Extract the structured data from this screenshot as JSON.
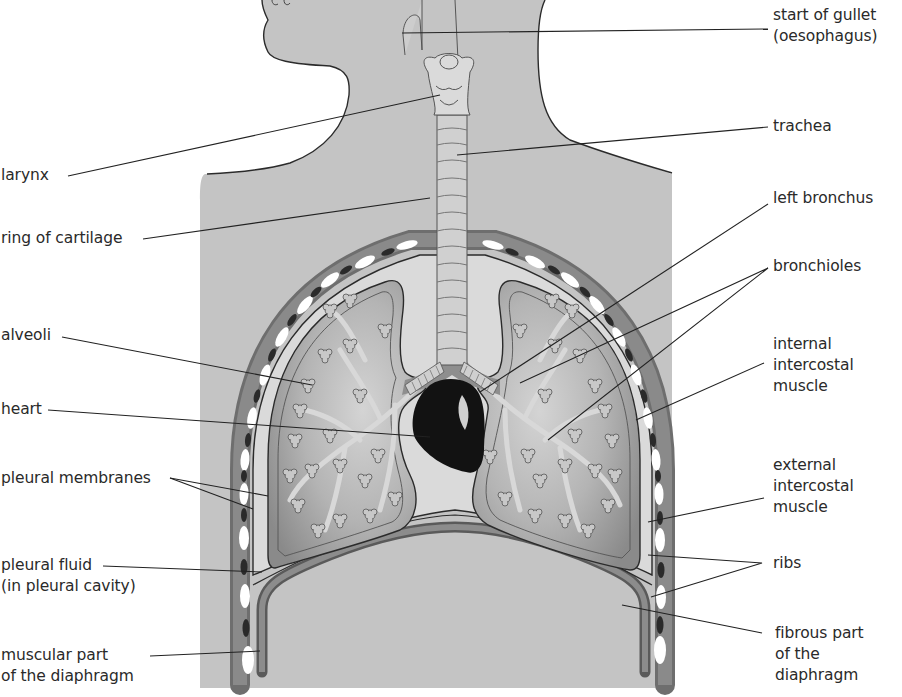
{
  "figure": {
    "colors": {
      "background": "#ffffff",
      "body": "#c4c4c4",
      "pleural_cavity": "#d8d8d8",
      "lung": "#9a9a9a",
      "lung_light": "#cfcfcf",
      "muscle": "#7a7a7a",
      "rib": "#ffffff",
      "heart": "#141414",
      "outline": "#2b2b2b",
      "leader_line": "#222222"
    }
  },
  "labels": {
    "left": [
      {
        "id": "larynx",
        "text": "larynx"
      },
      {
        "id": "ring-of-cartilage",
        "text": "ring of cartilage"
      },
      {
        "id": "alveoli",
        "text": "alveoli"
      },
      {
        "id": "heart",
        "text": "heart"
      },
      {
        "id": "pleural-membranes",
        "text": "pleural membranes"
      },
      {
        "id": "pleural-fluid",
        "text": "pleural fluid\n(in pleural cavity)"
      },
      {
        "id": "muscular-diaphragm",
        "text": "muscular part\nof the diaphragm"
      }
    ],
    "right": [
      {
        "id": "gullet",
        "text": "start of gullet\n(oesophagus)"
      },
      {
        "id": "trachea",
        "text": "trachea"
      },
      {
        "id": "left-bronchus",
        "text": "left bronchus"
      },
      {
        "id": "bronchioles",
        "text": "bronchioles"
      },
      {
        "id": "internal-intercostal",
        "text": "internal\nintercostal\nmuscle"
      },
      {
        "id": "external-intercostal",
        "text": "external\nintercostal\nmuscle"
      },
      {
        "id": "ribs",
        "text": "ribs"
      },
      {
        "id": "fibrous-diaphragm",
        "text": "fibrous part\nof the\ndiaphragm"
      }
    ]
  }
}
